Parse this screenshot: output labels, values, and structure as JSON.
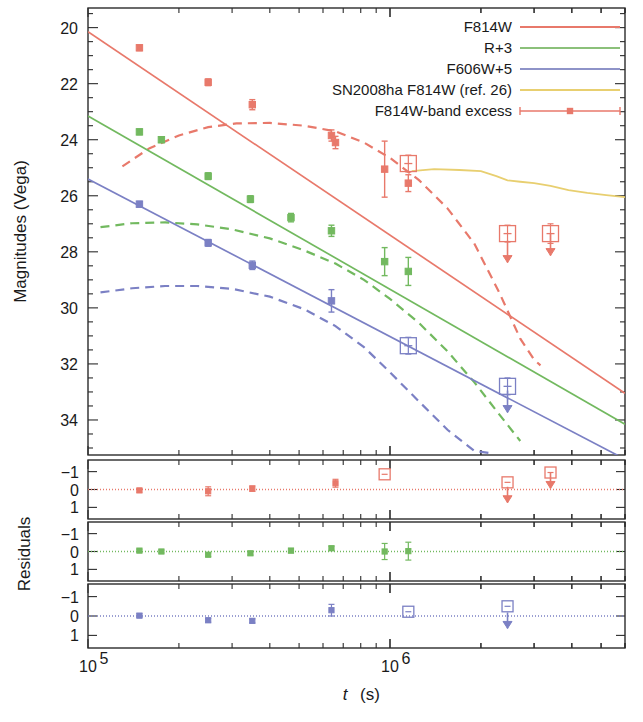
{
  "figure": {
    "ylabel_main": "Magnitudes (Vega)",
    "ylabel_resid": "Residuals",
    "xlabel": "t (s)",
    "xlabel_italic": "t",
    "xlabel_unit": "(s)"
  },
  "legend": {
    "items": [
      {
        "label": "F814W",
        "color": "#e8796b",
        "style": "solid",
        "marker": "none"
      },
      {
        "label": "R+3",
        "color": "#8bc07a",
        "style": "solid",
        "marker": "none"
      },
      {
        "label": "F606W+5",
        "color": "#8e93c8",
        "style": "solid",
        "marker": "none"
      },
      {
        "label": "SN2008ha F814W (ref. 26)",
        "color": "#e8cf70",
        "style": "solid",
        "marker": "none"
      },
      {
        "label": "F814W-band excess",
        "color": "#e8796b",
        "style": "errorbar",
        "marker": "square-filled"
      }
    ]
  },
  "axes": {
    "x_ticklabels": [
      "10^5",
      "10^6"
    ],
    "x_tickvalues": [
      100000,
      1000000
    ],
    "x_range": [
      100000,
      6000000
    ],
    "y_main_ticklabels": [
      "20",
      "22",
      "24",
      "26",
      "28",
      "30",
      "32",
      "34"
    ],
    "y_main_tickvalues": [
      20,
      22,
      24,
      26,
      28,
      30,
      32,
      34
    ],
    "y_main_range": [
      19.3,
      35.25
    ],
    "y_resid_ticklabels": [
      "-1",
      "0",
      "1"
    ],
    "y_resid_tickvalues": [
      -1,
      0,
      1
    ],
    "y_resid_range": [
      -1.65,
      1.65
    ]
  },
  "chart_data": {
    "type": "scatter",
    "title": "",
    "xlabel": "t (s)",
    "ylabel": "Magnitudes (Vega)",
    "xscale": "log",
    "xlim": [
      100000,
      6000000
    ],
    "ylim_main": [
      35.25,
      19.3
    ],
    "ylim_resid": [
      1.65,
      -1.65
    ],
    "grid": false,
    "legend_position": "top-right",
    "series": [
      {
        "name": "F814W",
        "color": "#e8796b",
        "fit_line": {
          "x": [
            100000,
            6000000
          ],
          "y": [
            20.15,
            33.05
          ]
        },
        "points": [
          {
            "x": 148000,
            "y": 20.72,
            "yerr": 0.1,
            "type": "detection"
          },
          {
            "x": 250000,
            "y": 21.95,
            "yerr": 0.12,
            "type": "detection"
          },
          {
            "x": 350000,
            "y": 22.75,
            "yerr": 0.18,
            "type": "detection"
          },
          {
            "x": 640000,
            "y": 23.85,
            "yerr": 0.2,
            "type": "detection"
          },
          {
            "x": 660000,
            "y": 24.1,
            "yerr": 0.22,
            "type": "detection"
          },
          {
            "x": 960000,
            "y": 25.05,
            "yerr": 1.0,
            "type": "detection"
          },
          {
            "x": 1150000,
            "y": 24.85,
            "yerr": 0.3,
            "type": "excess"
          },
          {
            "x": 1150000,
            "y": 25.55,
            "yerr": 0.3,
            "type": "detection"
          },
          {
            "x": 2450000,
            "y": 27.35,
            "yerr": 0.3,
            "type": "excess-limit"
          },
          {
            "x": 2450000,
            "y": 28.1,
            "type": "upper-limit"
          },
          {
            "x": 3400000,
            "y": 27.35,
            "yerr": 0.35,
            "type": "excess-limit"
          },
          {
            "x": 3400000,
            "y": 27.85,
            "type": "upper-limit"
          }
        ],
        "model_dashed": {
          "x": [
            130000,
            160000,
            200000,
            250000,
            310000,
            400000,
            520000,
            660000,
            820000,
            1000000,
            1250000,
            1550000,
            1900000,
            2300000,
            2700000,
            3000000,
            3150000
          ],
          "y": [
            24.95,
            24.3,
            23.85,
            23.55,
            23.42,
            23.4,
            23.5,
            23.7,
            24.1,
            24.65,
            25.45,
            26.45,
            27.7,
            29.45,
            31.1,
            31.85,
            32.05
          ]
        }
      },
      {
        "name": "R+3",
        "color": "#72b95f",
        "fit_line": {
          "x": [
            100000,
            6000000
          ],
          "y": [
            23.15,
            34.15
          ]
        },
        "points": [
          {
            "x": 148000,
            "y": 23.72,
            "yerr": 0.1,
            "type": "detection"
          },
          {
            "x": 175000,
            "y": 24.0,
            "yerr": 0.1,
            "type": "detection"
          },
          {
            "x": 250000,
            "y": 25.3,
            "yerr": 0.12,
            "type": "detection"
          },
          {
            "x": 345000,
            "y": 26.12,
            "yerr": 0.12,
            "type": "detection"
          },
          {
            "x": 470000,
            "y": 26.78,
            "yerr": 0.15,
            "type": "detection"
          },
          {
            "x": 640000,
            "y": 27.25,
            "yerr": 0.2,
            "type": "detection"
          },
          {
            "x": 960000,
            "y": 28.35,
            "yerr": 0.5,
            "type": "detection"
          },
          {
            "x": 1150000,
            "y": 28.7,
            "yerr": 0.5,
            "type": "detection"
          }
        ],
        "model_dashed": {
          "x": [
            110000,
            140000,
            180000,
            230000,
            300000,
            400000,
            520000,
            660000,
            820000,
            1000000,
            1250000,
            1550000,
            1900000,
            2300000,
            2700000
          ],
          "y": [
            27.12,
            26.98,
            26.95,
            27.02,
            27.2,
            27.52,
            27.95,
            28.42,
            29.0,
            29.68,
            30.55,
            31.55,
            32.65,
            33.8,
            34.75
          ]
        }
      },
      {
        "name": "F606W+5",
        "color": "#7b80c4",
        "fit_line": {
          "x": [
            100000,
            6000000
          ],
          "y": [
            25.4,
            35.4
          ]
        },
        "points": [
          {
            "x": 148000,
            "y": 26.3,
            "yerr": 0.1,
            "type": "detection"
          },
          {
            "x": 250000,
            "y": 27.68,
            "yerr": 0.12,
            "type": "detection"
          },
          {
            "x": 350000,
            "y": 28.48,
            "yerr": 0.15,
            "type": "detection"
          },
          {
            "x": 640000,
            "y": 29.75,
            "yerr": 0.4,
            "type": "detection"
          },
          {
            "x": 1150000,
            "y": 31.35,
            "yerr": 0.3,
            "type": "excess"
          },
          {
            "x": 2450000,
            "y": 32.8,
            "yerr": 0.3,
            "type": "excess-limit"
          },
          {
            "x": 2450000,
            "y": 33.45,
            "type": "upper-limit"
          }
        ],
        "model_dashed": {
          "x": [
            110000,
            140000,
            180000,
            230000,
            300000,
            400000,
            520000,
            660000,
            820000,
            1000000,
            1250000,
            1550000,
            1900000,
            2200000
          ],
          "y": [
            29.45,
            29.3,
            29.22,
            29.22,
            29.32,
            29.6,
            30.05,
            30.65,
            31.4,
            32.3,
            33.35,
            34.35,
            35.1,
            35.2
          ]
        }
      },
      {
        "name": "SN2008ha F814W (ref. 26)",
        "color": "#e8cf70",
        "curve": {
          "x": [
            1180000,
            1400000,
            1700000,
            2000000,
            2250000,
            2450000,
            2700000,
            3000000,
            3400000,
            3900000,
            4500000,
            5200000,
            6000000
          ],
          "y": [
            25.12,
            25.05,
            25.08,
            25.12,
            25.3,
            25.45,
            25.5,
            25.55,
            25.65,
            25.8,
            25.9,
            25.98,
            26.05
          ]
        }
      }
    ],
    "residual_panels": [
      {
        "name": "F814W residuals",
        "color": "#e8796b",
        "ylim": [
          1.65,
          -1.65
        ],
        "points": [
          {
            "x": 148000,
            "y": 0.05,
            "yerr": 0.1,
            "type": "detection"
          },
          {
            "x": 250000,
            "y": 0.1,
            "yerr": 0.25,
            "type": "detection"
          },
          {
            "x": 350000,
            "y": -0.05,
            "yerr": 0.15,
            "type": "detection"
          },
          {
            "x": 660000,
            "y": -0.35,
            "yerr": 0.22,
            "type": "detection"
          },
          {
            "x": 960000,
            "y": -0.85,
            "yerr": 0.12,
            "type": "excess"
          },
          {
            "x": 2450000,
            "y": -0.4,
            "yerr": 0.1,
            "type": "excess"
          },
          {
            "x": 2450000,
            "y": 0.35,
            "type": "upper-limit"
          },
          {
            "x": 3400000,
            "y": -0.95,
            "yerr": 0.1,
            "type": "excess"
          },
          {
            "x": 3400000,
            "y": -0.45,
            "type": "upper-limit"
          }
        ]
      },
      {
        "name": "R+3 residuals",
        "color": "#72b95f",
        "ylim": [
          1.65,
          -1.65
        ],
        "points": [
          {
            "x": 148000,
            "y": -0.05,
            "yerr": 0.08,
            "type": "detection"
          },
          {
            "x": 175000,
            "y": 0.0,
            "yerr": 0.08,
            "type": "detection"
          },
          {
            "x": 250000,
            "y": 0.18,
            "yerr": 0.1,
            "type": "detection"
          },
          {
            "x": 345000,
            "y": 0.1,
            "yerr": 0.1,
            "type": "detection"
          },
          {
            "x": 470000,
            "y": -0.05,
            "yerr": 0.12,
            "type": "detection"
          },
          {
            "x": 640000,
            "y": -0.18,
            "yerr": 0.12,
            "type": "detection"
          },
          {
            "x": 960000,
            "y": 0.0,
            "yerr": 0.45,
            "type": "detection"
          },
          {
            "x": 1150000,
            "y": -0.02,
            "yerr": 0.5,
            "type": "detection"
          }
        ]
      },
      {
        "name": "F606W+5 residuals",
        "color": "#7b80c4",
        "ylim": [
          1.65,
          -1.65
        ],
        "points": [
          {
            "x": 148000,
            "y": -0.02,
            "yerr": 0.1,
            "type": "detection"
          },
          {
            "x": 250000,
            "y": 0.22,
            "yerr": 0.1,
            "type": "detection"
          },
          {
            "x": 350000,
            "y": 0.25,
            "yerr": 0.1,
            "type": "detection"
          },
          {
            "x": 640000,
            "y": -0.3,
            "yerr": 0.3,
            "type": "detection"
          },
          {
            "x": 1150000,
            "y": -0.22,
            "yerr": 0.14,
            "type": "excess"
          },
          {
            "x": 2450000,
            "y": -0.5,
            "yerr": 0.14,
            "type": "excess"
          },
          {
            "x": 2450000,
            "y": 0.28,
            "type": "upper-limit"
          }
        ]
      }
    ]
  }
}
